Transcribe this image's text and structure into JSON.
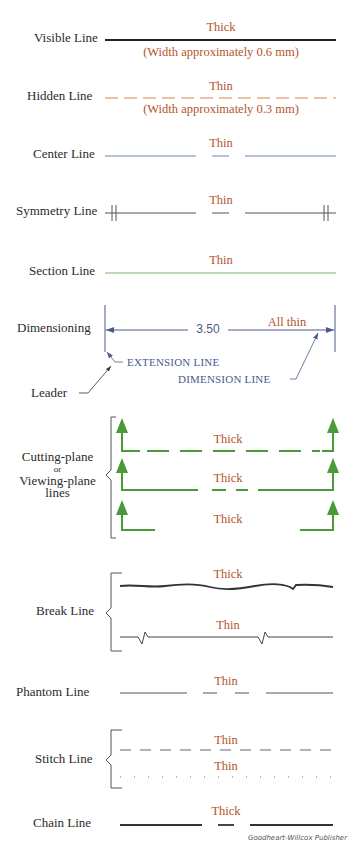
{
  "colors": {
    "label_text": "#2b2b2b",
    "annotation_text": "#b4552a",
    "visible_line": "#222222",
    "hidden_line": "#d9884a",
    "center_line": "#6f86b5",
    "symmetry_line": "#555555",
    "section_line": "#7cb36a",
    "dimension_line": "#4a5a8c",
    "cutting_plane": "#4a9a3a",
    "break_line": "#333333",
    "phantom_line": "#555555",
    "stitch_line": "#666666",
    "chain_line": "#333333"
  },
  "rows": {
    "visible": {
      "label": "Visible Line",
      "note_top": "Thick",
      "note_bottom": "(Width approximately 0.6 mm)"
    },
    "hidden": {
      "label": "Hidden Line",
      "note_top": "Thin",
      "note_bottom": "(Width approximately 0.3 mm)"
    },
    "center": {
      "label": "Center Line",
      "note": "Thin"
    },
    "symmetry": {
      "label": "Symmetry Line",
      "note": "Thin"
    },
    "section": {
      "label": "Section Line",
      "note": "Thin"
    },
    "dimensioning": {
      "label": "Dimensioning",
      "value": "3.50",
      "note": "All thin",
      "leader_label": "Leader",
      "extension_label": "EXTENSION LINE",
      "dimension_label": "DIMENSION LINE"
    },
    "cutting_plane": {
      "label_line1": "Cutting-plane",
      "label_line2": "or",
      "label_line3": "Viewing-plane",
      "label_line4": "lines",
      "notes": [
        "Thick",
        "Thick",
        "Thick"
      ]
    },
    "break": {
      "label": "Break Line",
      "note_top": "Thick",
      "note_bottom": "Thin"
    },
    "phantom": {
      "label": "Phantom Line",
      "note": "Thin"
    },
    "stitch": {
      "label": "Stitch Line",
      "note_top": "Thin",
      "note_bottom": "Thin"
    },
    "chain": {
      "label": "Chain Line",
      "note": "Thick"
    }
  },
  "credit": "Goodheart-Willcox Publisher"
}
